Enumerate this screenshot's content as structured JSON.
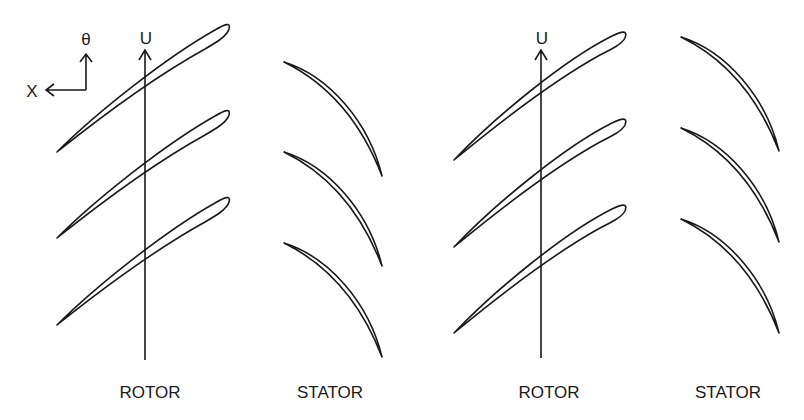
{
  "figure": {
    "coordinate_axes": {
      "x_label": "X",
      "theta_label": "θ"
    },
    "stages": [
      {
        "rotor_label": "ROTOR",
        "stator_label": "STATOR",
        "velocity_label": "U"
      },
      {
        "rotor_label": "ROTOR",
        "stator_label": "STATOR",
        "velocity_label": "U"
      }
    ],
    "colors": {
      "stroke": "#1a1a1a",
      "background": "#ffffff"
    }
  }
}
